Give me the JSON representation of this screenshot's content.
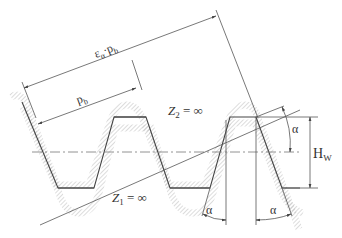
{
  "diagram": {
    "labels": {
      "contact_length": "εα·pb",
      "contact_length_main": "ε",
      "contact_length_sub": "α",
      "contact_length_dot": "·p",
      "contact_length_sub2": "b",
      "base_pitch_main": "p",
      "base_pitch_sub": "b",
      "rack_upper_main": "Z",
      "rack_upper_sub": "2",
      "rack_upper_rest": " = ∞",
      "rack_lower_main": "Z",
      "rack_lower_sub": "1",
      "rack_lower_rest": " = ∞",
      "angle_right": "α",
      "angle_bottom_left": "α",
      "angle_bottom_right": "α",
      "working_depth_main": "H",
      "working_depth_sub": "W"
    },
    "colors": {
      "line": "#555555",
      "profile": "#444444",
      "hatch": "#999999",
      "text": "#333333"
    }
  }
}
